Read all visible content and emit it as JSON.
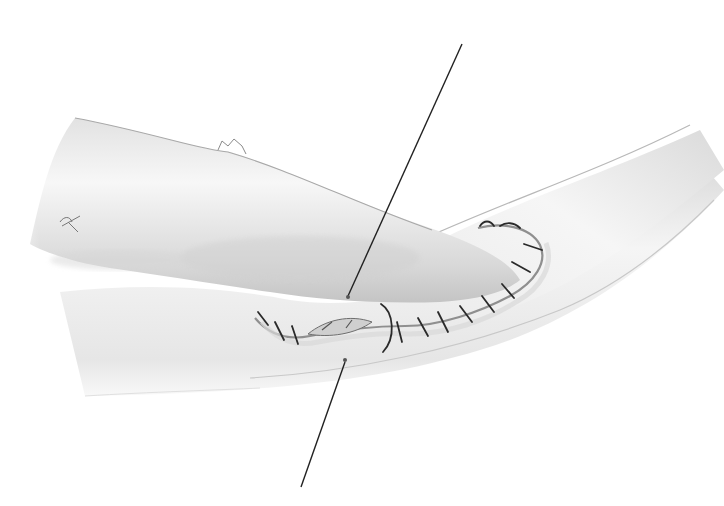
{
  "figure": {
    "colors": {
      "background": "#ffffff",
      "vessel_fill_light": "#f4f4f4",
      "vessel_fill_mid": "#dcdcdc",
      "vessel_shadow": "#bdbdbd",
      "outline": "#9a9a9a",
      "suture": "#2a2a2a",
      "leader_line": "#222222"
    },
    "leader_lines": [
      {
        "id": "upper",
        "x1": 462,
        "y1": 44,
        "x2": 348,
        "y2": 296
      },
      {
        "id": "lower",
        "x1": 345,
        "y1": 362,
        "x2": 301,
        "y2": 487
      }
    ]
  }
}
